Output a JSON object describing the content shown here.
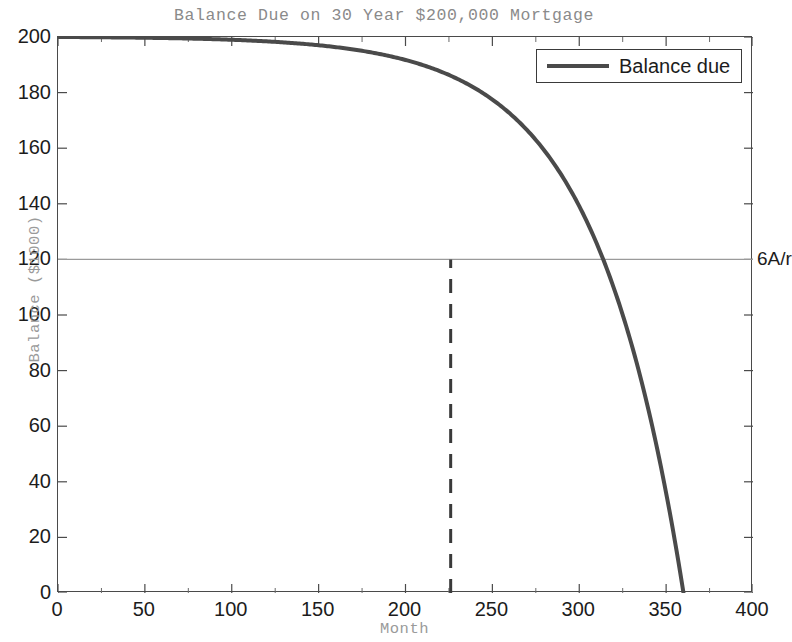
{
  "chart_data": {
    "type": "line",
    "title": "Balance Due on 30 Year $200,000 Mortgage",
    "xlabel": "Month",
    "ylabel": "Balance ($1000)",
    "xlim": [
      0,
      400
    ],
    "ylim": [
      0,
      200
    ],
    "xticks": [
      0,
      50,
      100,
      150,
      200,
      250,
      300,
      350,
      400
    ],
    "yticks": [
      0,
      20,
      40,
      60,
      80,
      100,
      120,
      140,
      160,
      180,
      200
    ],
    "grid": false,
    "legend": {
      "position": "top-right",
      "entries": [
        {
          "label": "Balance due",
          "color": "#4a4a4a",
          "style": "solid",
          "width": 4
        }
      ]
    },
    "series": [
      {
        "name": "Balance due",
        "color": "#4a4a4a",
        "style": "solid",
        "x": [
          0,
          12,
          24,
          36,
          48,
          60,
          72,
          84,
          96,
          108,
          120,
          132,
          144,
          156,
          168,
          180,
          192,
          204,
          216,
          222,
          226,
          228,
          240,
          252,
          264,
          276,
          288,
          300,
          312,
          324,
          336,
          348,
          360
        ],
        "y": [
          200.0,
          197.8,
          195.4,
          192.8,
          190.0,
          187.0,
          183.8,
          180.2,
          176.4,
          172.3,
          167.9,
          163.1,
          157.9,
          152.4,
          146.3,
          139.8,
          132.8,
          125.2,
          117.0,
          112.6,
          119.7,
          108.1,
          103.0,
          93.2,
          82.7,
          71.3,
          59.1,
          45.8,
          31.5,
          16.1,
          8.3,
          4.2,
          0.0
        ]
      }
    ],
    "annotations": [
      {
        "name": "horizontal-reference-line",
        "type": "hline",
        "y": 120,
        "label": "6A/r",
        "color": "#9a9a9a",
        "style": "solid"
      },
      {
        "name": "vertical-dashed-marker",
        "type": "vline",
        "x": 226,
        "y_from": 0,
        "y_to": 120,
        "color": "#3a3a3a",
        "style": "dashed"
      }
    ]
  },
  "title": {
    "text": "Balance Due on 30 Year $200,000 Mortgage"
  },
  "axes": {
    "x": {
      "name": "Month",
      "ticks": [
        "0",
        "50",
        "100",
        "150",
        "200",
        "250",
        "300",
        "350",
        "400"
      ]
    },
    "y": {
      "name": "Balance ($1000)",
      "ticks": [
        "0",
        "20",
        "40",
        "60",
        "80",
        "100",
        "120",
        "140",
        "160",
        "180",
        "200"
      ]
    }
  },
  "legend": {
    "label": "Balance due"
  },
  "annotation": {
    "reference_label": "6A/r"
  },
  "colors": {
    "curve": "#4a4a4a",
    "reference_line": "#9a9a9a",
    "dashed_line": "#3a3a3a",
    "axis": "#4a4a4a",
    "label_gray": "#9a9a9a",
    "tick_text": "#1c1c1c"
  }
}
